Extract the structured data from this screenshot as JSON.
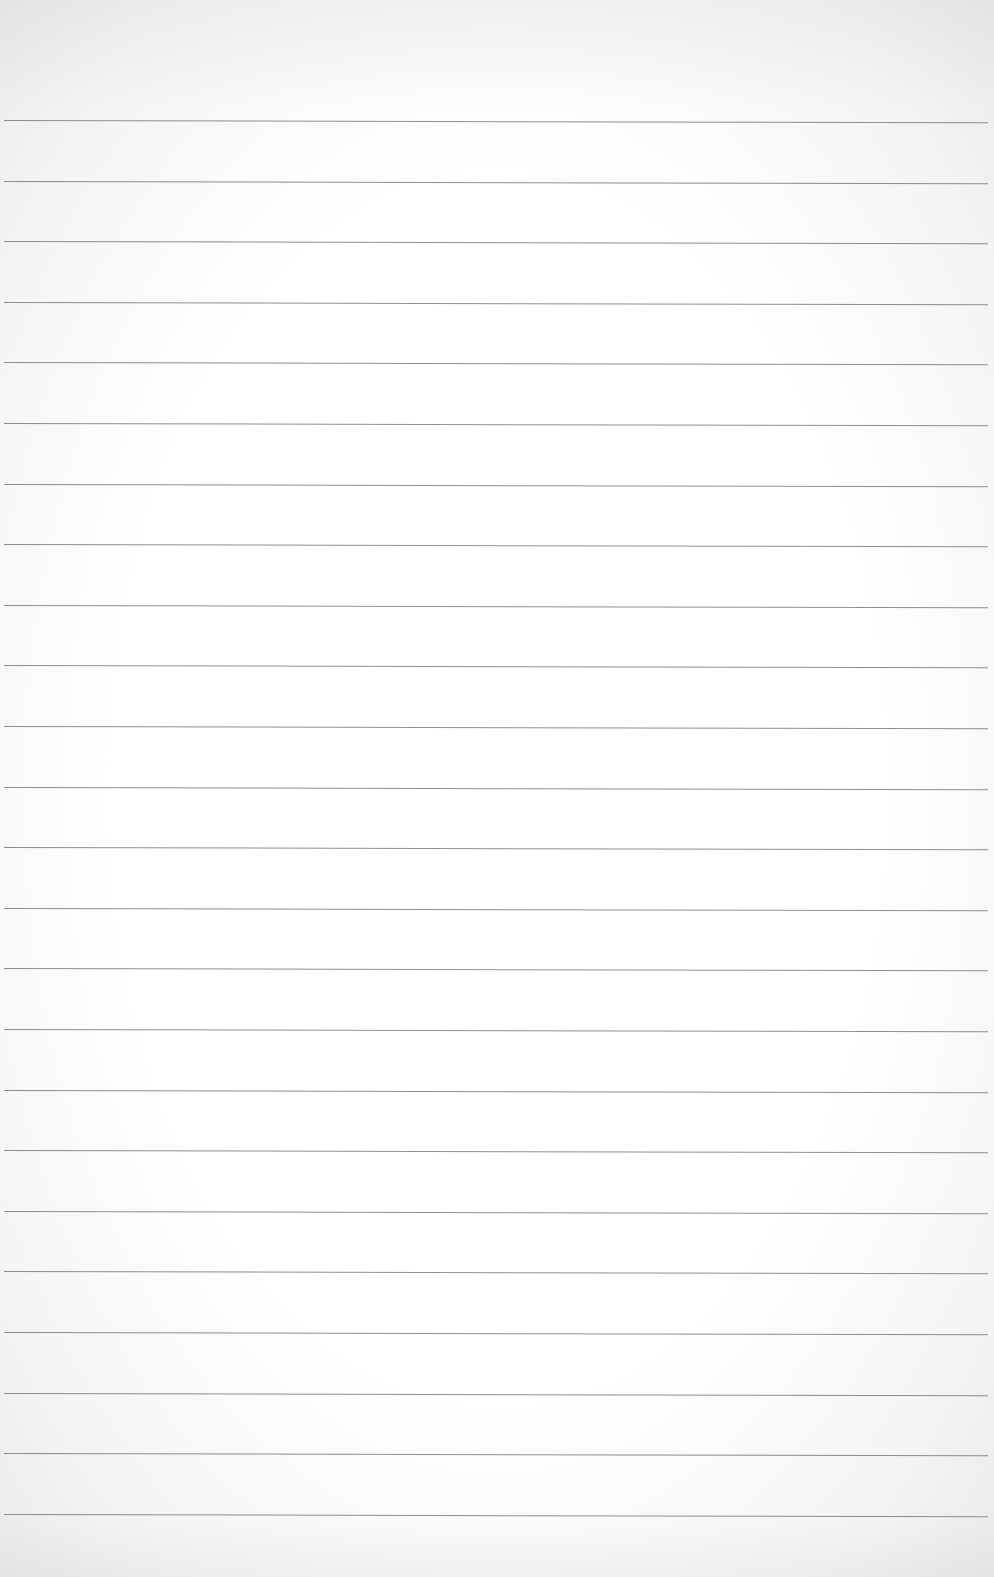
{
  "page": {
    "type": "lined-paper",
    "content": "",
    "rule_count": 24,
    "rule_start_y": 120,
    "rule_spacing_px": 60.6,
    "rule_color": "#7a7a7a",
    "paper_color": "#ffffff"
  }
}
